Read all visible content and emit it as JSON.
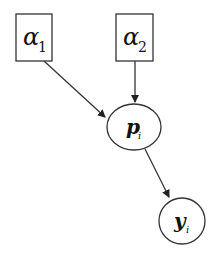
{
  "diagram": {
    "type": "graphical-model",
    "nodes": [
      {
        "id": "alpha1",
        "shape": "rect",
        "symbol": "α",
        "subscript": "1"
      },
      {
        "id": "alpha2",
        "shape": "rect",
        "symbol": "α",
        "subscript": "2"
      },
      {
        "id": "p_i",
        "shape": "ellipse",
        "symbol": "p",
        "subscript": "i"
      },
      {
        "id": "y_i",
        "shape": "circle",
        "symbol": "y",
        "subscript": "i"
      }
    ],
    "edges": [
      {
        "from": "alpha1",
        "to": "p_i"
      },
      {
        "from": "alpha2",
        "to": "p_i"
      },
      {
        "from": "p_i",
        "to": "y_i"
      }
    ],
    "colors": {
      "stroke": "#333333",
      "background": "#ffffff"
    }
  }
}
